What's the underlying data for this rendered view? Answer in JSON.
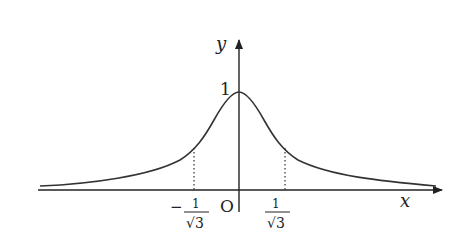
{
  "figure": {
    "axes": {
      "x_label": "x",
      "y_label": "y",
      "origin_label": "O"
    },
    "y_tick": {
      "label": "1",
      "value": 1
    },
    "x_ticks": [
      {
        "label_sign": "−",
        "numerator": "1",
        "denominator": "√3",
        "value": -0.577
      },
      {
        "label_sign": "",
        "numerator": "1",
        "denominator": "√3",
        "value": 0.577
      }
    ],
    "marked_points": {
      "style": "dotted vertical lines from x-axis up to curve at x = ±1/√3"
    },
    "colors": {
      "curve": "#333333",
      "axes": "#222222",
      "background": "#ffffff"
    }
  }
}
